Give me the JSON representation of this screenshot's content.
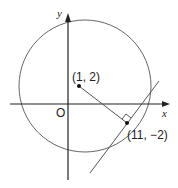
{
  "diagram": {
    "axes": {
      "x_label": "x",
      "y_label": "y",
      "origin_label": "O"
    },
    "circle": {
      "center_label": "(1, 2)"
    },
    "tangent_point": {
      "label": "(11, −2)"
    },
    "colors": {
      "stroke": "#555555",
      "axis": "#222222",
      "point": "#111111"
    }
  }
}
